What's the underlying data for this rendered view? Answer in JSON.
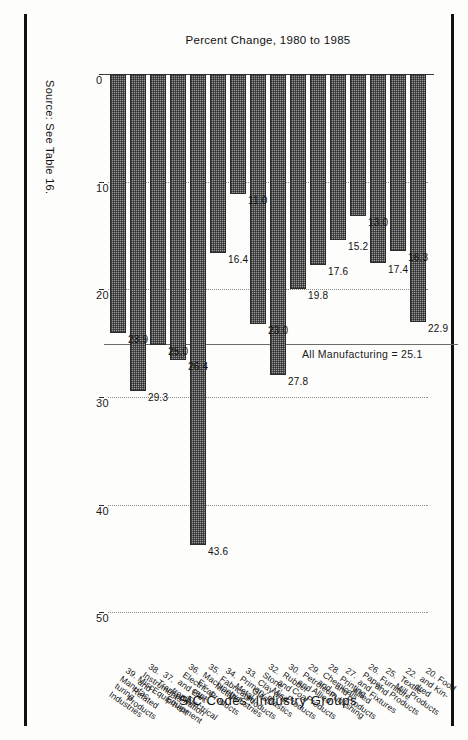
{
  "figure": {
    "source_note": "Source: See Table 16.",
    "reference_line_label": "All Manufacturing = 25.1"
  },
  "chart_data": {
    "type": "bar",
    "orientation": "vertical",
    "title": "",
    "xlabel": "SIC Codes: Industry Groups",
    "ylabel": "Percent Change, 1980 to 1985",
    "ylim": [
      0,
      55
    ],
    "yticks": [
      0,
      10,
      20,
      30,
      40,
      50
    ],
    "ytick_labels": [
      "0",
      "10",
      "20",
      "30",
      "40",
      "50"
    ],
    "grid": "dotted vertical gridlines at each tick",
    "legend": "none",
    "annotations": [
      {
        "text": "All Manufacturing = 25.1",
        "value": 25.1,
        "type": "reference-line"
      }
    ],
    "categories": [
      "20. Food and Kin-\ndred Products",
      "22. Textile Mill\nProducts",
      "25. Furniture and\nFixtures",
      "26. Paper and Allied\nProducts",
      "27. Printing and\nPublishing",
      "28. Chemicals and\nAllied Products",
      "29. Petroleum and\nCoal Products",
      "30. Rubber and\nMisc. Plastics",
      "32. Stone, Clay and\nGlass Products",
      "33. Primary Metal\nIndustries",
      "34. Fabricated\nMetal Products",
      "35. Machinery, Ex-\ncept Electrical",
      "36. Electrical and Elec-\ntronic Equipment",
      "37. Transportation\nEquipment",
      "38. Instruments and\nRelated Products",
      "39. Misc. Manufac-\nturing Industries"
    ],
    "values": [
      22.9,
      16.3,
      17.4,
      13.0,
      15.2,
      17.6,
      19.8,
      27.8,
      23.0,
      11.0,
      16.4,
      43.6,
      26.4,
      25.0,
      29.3,
      23.9
    ],
    "value_labels": [
      "22.9",
      "16.3",
      "17.4",
      "13.0",
      "15.2",
      "17.6",
      "19.8",
      "27.8",
      "23.0",
      "11.0",
      "16.4",
      "43.6",
      "26.4",
      "25.0",
      "29.3",
      "23.9"
    ]
  }
}
